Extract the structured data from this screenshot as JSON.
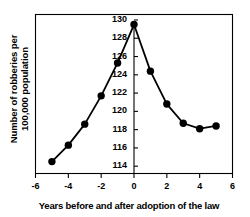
{
  "chart_data": {
    "type": "line",
    "title": "",
    "xlabel": "Years before and after adoption of the law",
    "ylabel": "Number of robberies per 100,000 population",
    "ylabel_line1": "Number of robberies per",
    "ylabel_line2": "100,000 population",
    "x": [
      -5,
      -4,
      -3,
      -2,
      -1,
      0,
      1,
      2,
      3,
      4,
      5
    ],
    "values": [
      114.5,
      116.3,
      118.6,
      121.7,
      125.3,
      129.5,
      124.4,
      120.8,
      118.7,
      118.1,
      118.4
    ],
    "series": [
      {
        "name": "Robbery rate",
        "values": [
          114.5,
          116.3,
          118.6,
          121.7,
          125.3,
          129.5,
          124.4,
          120.8,
          118.7,
          118.1,
          118.4
        ]
      }
    ],
    "xlim": [
      -6,
      6
    ],
    "ylim": [
      113.2,
      130.6
    ],
    "xticks": [
      -6,
      -4,
      -2,
      0,
      2,
      4,
      6
    ],
    "xtick_labels": [
      "-6",
      "-4",
      "-2",
      "0",
      "2",
      "4",
      "6"
    ],
    "yticks": [
      114,
      116,
      118,
      120,
      122,
      124,
      126,
      128,
      130
    ],
    "ytick_labels": [
      "114",
      "116",
      "118",
      "120",
      "122",
      "124",
      "126",
      "128",
      "130"
    ],
    "grid": false,
    "legend": "none",
    "marker": "filled-circle",
    "line_color": "#000000",
    "marker_color": "#000000",
    "axis_color": "#000000",
    "background": "#ffffff",
    "yaxis_position_at_x": 0,
    "frame": "box"
  }
}
